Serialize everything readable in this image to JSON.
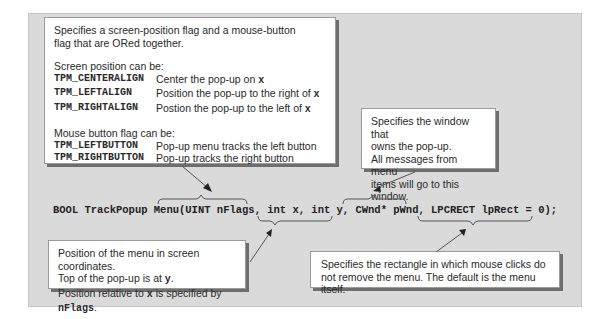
{
  "signature": {
    "text": "BOOL TrackPopup Menu(UINT nFlags, int x, int y, CWnd* pWnd, LPCRECT lpRect = 0);"
  },
  "callouts": {
    "flags": {
      "intro": "Specifies a screen-position flag and a mouse-button flag that are ORed together.",
      "screen_heading": "Screen position can be:",
      "screen_flags": [
        {
          "name": "TPM_CENTERALIGN",
          "desc_text": "Center the pop-up on ",
          "desc_var": "x"
        },
        {
          "name": "TPM_LEFTALIGN",
          "desc_text": "Position the pop-up to the right of ",
          "desc_var": "x"
        },
        {
          "name": "TPM_RIGHTALIGN",
          "desc_text": "Postion the pop-up to the left of ",
          "desc_var": "x"
        }
      ],
      "mouse_heading": "Mouse button flag can be:",
      "mouse_flags": [
        {
          "name": "TPM_LEFTBUTTON",
          "desc": "Pop-up menu tracks the left button"
        },
        {
          "name": "TPM_RIGHTBUTTON",
          "desc": "Pop-up tracks the right button"
        }
      ]
    },
    "window": {
      "lines": [
        "Specifies the window that",
        "owns the pop-up.",
        "All messages from menu",
        "items will go to this window."
      ]
    },
    "position": {
      "line1": "Position of the menu in screen coordinates.",
      "line2_text": "Top of the pop-up is  at ",
      "line2_var": "y",
      "line2_end": ".",
      "line3_text": "Position relative to ",
      "line3_var": "x",
      "line3_mid": " is specified by ",
      "line3_var2": "nFlags",
      "line3_end": "."
    },
    "rect": {
      "line1": "Specifies the rectangle in which mouse clicks do",
      "line2": "not remove the menu. The default is the menu itself."
    }
  },
  "colors": {
    "panel": "#dadada",
    "callout_bg": "#ffffff",
    "shadow": "#6e6e6e",
    "line": "#555555"
  }
}
